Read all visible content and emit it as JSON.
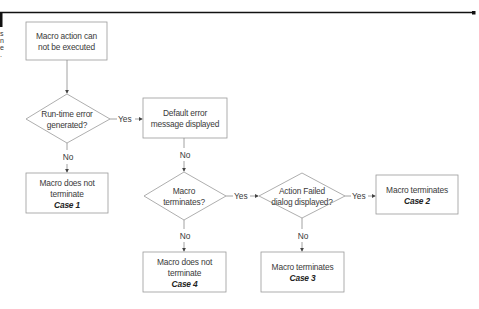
{
  "nodes": {
    "start": {
      "lines": [
        "Macro action can",
        "not be executed"
      ]
    },
    "runtime_error": {
      "lines": [
        "Run-time error",
        "generated?"
      ]
    },
    "default_error": {
      "lines": [
        "Default error",
        "message displayed"
      ]
    },
    "case1": {
      "lines": [
        "Macro does not",
        "terminate"
      ],
      "case": "Case 1"
    },
    "macro_terminates_q": {
      "lines": [
        "Macro",
        "terminates?"
      ]
    },
    "action_failed_q": {
      "lines": [
        "Action Failed",
        "dialog displayed?"
      ]
    },
    "case2": {
      "lines": [
        "Macro terminates"
      ],
      "case": "Case 2"
    },
    "case4": {
      "lines": [
        "Macro does not",
        "terminate"
      ],
      "case": "Case 4"
    },
    "case3": {
      "lines": [
        "Macro terminates"
      ],
      "case": "Case 3"
    }
  },
  "edges": {
    "yes": "Yes",
    "no": "No"
  },
  "colors": {
    "line": "#8a8a8a",
    "frame": "#111111"
  }
}
